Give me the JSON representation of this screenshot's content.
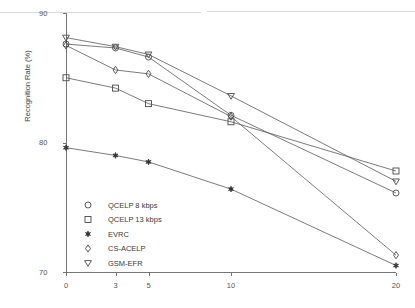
{
  "chart_data": {
    "type": "line",
    "title": "",
    "subtitle": "",
    "xlabel": "",
    "ylabel": "Recognition Rate (%)",
    "xlim": [
      0,
      20
    ],
    "ylim": [
      70,
      90
    ],
    "x": [
      0,
      3,
      5,
      10,
      20
    ],
    "xticks": [
      "0",
      "3",
      "5",
      "10",
      "20"
    ],
    "yticks": [
      "90",
      "80",
      "70"
    ],
    "ytick_values": [
      90,
      80,
      70
    ],
    "grid": false,
    "legend_position": "lower-left-inside",
    "series": [
      {
        "name": "QCELP 8 kbps",
        "marker": "circle-open",
        "values": [
          87.6,
          87.3,
          86.6,
          82.1,
          76.1
        ]
      },
      {
        "name": "QCELP 13 kbps",
        "marker": "square-open",
        "values": [
          85.0,
          84.2,
          83.0,
          81.6,
          77.8
        ]
      },
      {
        "name": "EVRC",
        "marker": "star-filled",
        "values": [
          79.6,
          79.0,
          78.5,
          76.4,
          70.5
        ]
      },
      {
        "name": "CS-ACELP",
        "marker": "diamond-open",
        "values": [
          87.5,
          85.6,
          85.3,
          82.0,
          71.3
        ]
      },
      {
        "name": "GSM-EFR",
        "marker": "triangle-down-open",
        "values": [
          88.1,
          87.4,
          86.8,
          83.6,
          77.0
        ]
      }
    ],
    "colors": {
      "line": "#5a5a5a",
      "marker": "#4a4a4a",
      "axis": "#777777",
      "text": "#3a3a3a",
      "background": "#ffffff"
    }
  }
}
